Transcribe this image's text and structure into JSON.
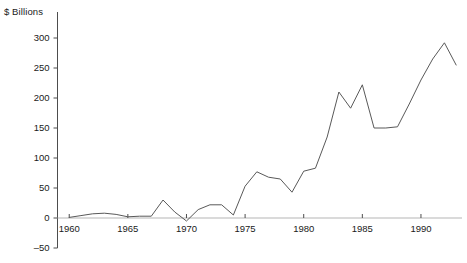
{
  "chart_data": {
    "type": "line",
    "title": "",
    "subtitle": "",
    "xlabel": "",
    "ylabel": "$ Billions",
    "unit_label": "$ Billions",
    "grid": false,
    "legend": "none",
    "line_color": "#595959",
    "baseline_color": "#b5b5b5",
    "axis_color": "#4d4d4d",
    "xlim": [
      1959,
      1993.5
    ],
    "ylim": [
      -50,
      300
    ],
    "ytick_labels": [
      "300",
      "250",
      "200",
      "150",
      "100",
      "50",
      "0",
      "–50"
    ],
    "yticks": [
      300,
      250,
      200,
      150,
      100,
      50,
      0,
      -50
    ],
    "xtick_labels": [
      "1960",
      "1965",
      "1970",
      "1975",
      "1980",
      "1985",
      "1990"
    ],
    "xticks": [
      1960,
      1965,
      1970,
      1975,
      1980,
      1985,
      1990
    ],
    "x": [
      1960,
      1961,
      1962,
      1963,
      1964,
      1965,
      1966,
      1967,
      1968,
      1969,
      1970,
      1971,
      1972,
      1973,
      1974,
      1975,
      1976,
      1977,
      1978,
      1979,
      1980,
      1981,
      1982,
      1983,
      1984,
      1985,
      1986,
      1987,
      1988,
      1989,
      1990,
      1991,
      1992,
      1993
    ],
    "values": [
      1,
      4,
      7,
      8,
      6,
      2,
      3,
      3,
      30,
      10,
      -5,
      14,
      22,
      22,
      5,
      53,
      77,
      68,
      65,
      43,
      78,
      83,
      135,
      210,
      183,
      222,
      150,
      150,
      152,
      190,
      230,
      265,
      292,
      255
    ],
    "series": [
      {
        "name": "",
        "values": [
          1,
          4,
          7,
          8,
          6,
          2,
          3,
          3,
          30,
          10,
          -5,
          14,
          22,
          22,
          5,
          53,
          77,
          68,
          65,
          43,
          78,
          83,
          135,
          210,
          183,
          222,
          150,
          150,
          152,
          190,
          230,
          265,
          292,
          255
        ]
      }
    ]
  }
}
